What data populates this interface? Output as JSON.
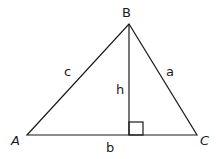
{
  "diagram": {
    "vertices": [
      {
        "id": "A",
        "label": "A",
        "x": 27,
        "y": 135
      },
      {
        "id": "B",
        "label": "B",
        "x": 129,
        "y": 24
      },
      {
        "id": "C",
        "label": "C",
        "x": 197,
        "y": 135
      }
    ],
    "sides": {
      "a": "a",
      "b": "b",
      "c": "c"
    },
    "height_label": "h",
    "right_angle_marker": true,
    "stroke_color": "#1a1a1a"
  }
}
